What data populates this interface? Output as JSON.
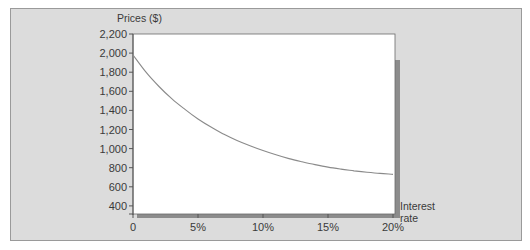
{
  "chart_data": {
    "type": "line",
    "title": "",
    "ylabel": "Prices ($)",
    "xlabel": "Interest rate",
    "xlabel_lines": [
      "Interest",
      "rate"
    ],
    "x_ticks": [
      "0",
      "5%",
      "10%",
      "15%",
      "20%"
    ],
    "x_tick_values": [
      0,
      5,
      10,
      15,
      20
    ],
    "y_ticks": [
      "2,200",
      "2,000",
      "1,800",
      "1,600",
      "1,400",
      "1,200",
      "1,000",
      "800",
      "600",
      "400"
    ],
    "y_tick_values": [
      2200,
      2000,
      1800,
      1600,
      1400,
      1200,
      1000,
      800,
      600,
      400
    ],
    "xlim": [
      0,
      20
    ],
    "ylim": [
      275,
      2200
    ],
    "grid": false,
    "legend": null,
    "series": [
      {
        "name": "Price",
        "x": [
          0,
          1,
          2,
          3,
          4,
          5,
          6,
          7,
          8,
          9,
          10,
          11,
          12,
          13,
          14,
          15,
          16,
          17,
          18,
          19,
          20
        ],
        "values": [
          1980,
          1800,
          1650,
          1520,
          1410,
          1310,
          1225,
          1150,
          1085,
          1030,
          980,
          935,
          895,
          862,
          832,
          806,
          785,
          767,
          752,
          740,
          730
        ]
      }
    ],
    "colors": {
      "line": "#8a8a8a",
      "panel": "#dcdcdc",
      "plot": "#ffffff",
      "shadow": "#8c8c8c"
    }
  }
}
